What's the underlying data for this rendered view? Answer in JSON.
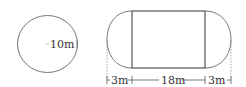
{
  "circle": {
    "radius_label": "10m"
  },
  "stadium": {
    "left_label": "3m",
    "middle_label": "18m",
    "right_label": "3m"
  },
  "colors": {
    "stroke": "#555555",
    "text": "#333333",
    "background": "#ffffff"
  }
}
